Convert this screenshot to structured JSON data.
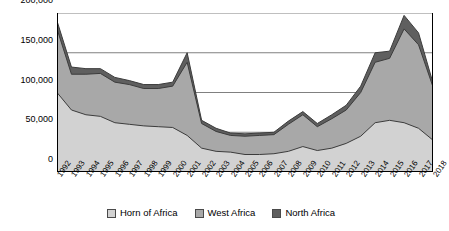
{
  "chart_data": {
    "type": "area",
    "stacked": true,
    "title": "",
    "xlabel": "",
    "ylabel": "",
    "ylim": [
      0,
      200000
    ],
    "yticks": [
      0,
      50000,
      100000,
      150000,
      200000
    ],
    "ytick_labels": [
      "0",
      "50,000",
      "100,000",
      "150,000",
      "200,000"
    ],
    "grid": true,
    "legend_position": "bottom",
    "categories": [
      "1992",
      "1993",
      "1994",
      "1995",
      "1996",
      "1997",
      "1998",
      "1999",
      "2000",
      "2001",
      "2002",
      "2003",
      "2004",
      "2005",
      "2006",
      "2007",
      "2008",
      "2009",
      "2010",
      "2011",
      "2012",
      "2013",
      "2014",
      "2015",
      "2016",
      "2017",
      "2018"
    ],
    "series": [
      {
        "name": "Horn of Africa",
        "color": "#d2d2d2",
        "values": [
          100000,
          78000,
          72000,
          70000,
          62000,
          60000,
          58000,
          57000,
          56000,
          46000,
          30000,
          26000,
          25000,
          22000,
          22000,
          23000,
          26000,
          32000,
          27000,
          30000,
          36000,
          45000,
          62000,
          65000,
          62000,
          55000,
          40000
        ]
      },
      {
        "name": "West Africa",
        "color": "#a8a8a8",
        "values": [
          80000,
          45000,
          51000,
          54000,
          51000,
          50000,
          47000,
          48000,
          52000,
          92000,
          31000,
          25000,
          21000,
          23000,
          24000,
          24000,
          34000,
          40000,
          30000,
          37000,
          42000,
          55000,
          76000,
          78000,
          118000,
          105000,
          67000
        ]
      },
      {
        "name": "North Africa",
        "color": "#5f5f5f",
        "values": [
          10000,
          9000,
          7000,
          6000,
          6000,
          5000,
          5000,
          5000,
          5000,
          12000,
          4000,
          4000,
          3000,
          3000,
          3000,
          3000,
          4000,
          4000,
          4000,
          5000,
          6000,
          8000,
          12000,
          9000,
          17000,
          15000,
          5000
        ]
      }
    ],
    "totals": [
      190000,
      132000,
      130000,
      130000,
      119000,
      115000,
      110000,
      110000,
      113000,
      150000,
      65000,
      55000,
      49000,
      48000,
      49000,
      50000,
      64000,
      76000,
      61000,
      72000,
      84000,
      108000,
      150000,
      152000,
      197000,
      175000,
      112000
    ]
  },
  "legend": {
    "items": [
      {
        "label": "Horn of Africa"
      },
      {
        "label": "West Africa"
      },
      {
        "label": "North Africa"
      }
    ]
  }
}
